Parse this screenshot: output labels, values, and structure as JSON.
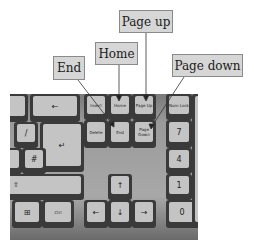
{
  "labels": {
    "page_up": "Page up",
    "home": "Home",
    "end": "End",
    "page_down": "Page down"
  },
  "keys": {
    "backspace": "←",
    "enter": "↵",
    "insert": "Insert",
    "home": "Home",
    "page_up": "Page Up",
    "delete": "Delete",
    "end": "End",
    "page_down": "Page Down",
    "num_lock": "Num Lock",
    "num7": "7",
    "num7_sub": "Home",
    "num4": "4",
    "num4_sub": "←",
    "num1": "1",
    "num1_sub": "End",
    "num0": "0",
    "num0_sub": "Ins",
    "ctrl": "Ctrl",
    "win": "⊞",
    "up": "↑",
    "down": "↓",
    "left": "←",
    "right": "→",
    "shift": "⇧",
    "hash": "#",
    "slash": "/"
  },
  "colors": {
    "label_bg": "#d6d6d6",
    "label_border": "#8a8a8a",
    "pointer_line": "#333333"
  }
}
